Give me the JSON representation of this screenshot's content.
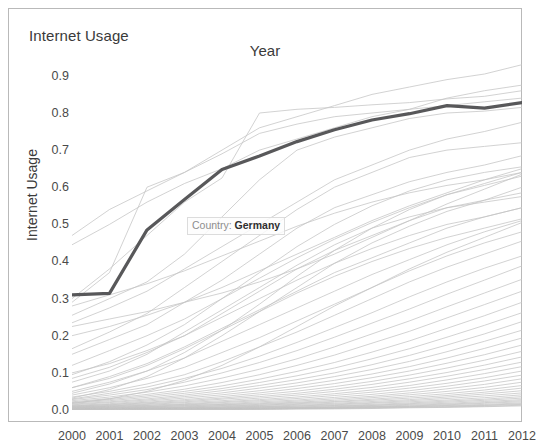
{
  "frame": {
    "corner_label": "Internet Usage",
    "title": "Year"
  },
  "tooltip": {
    "prefix": "Country:",
    "value": "Germany"
  },
  "chart_data": {
    "type": "line",
    "title": "Year",
    "corner_label": "Internet Usage",
    "xlabel": "Year",
    "ylabel": "Internet Usage",
    "xlim": [
      2000,
      2012
    ],
    "ylim": [
      0.0,
      0.94
    ],
    "grid": false,
    "legend": false,
    "x": [
      2000,
      2001,
      2002,
      2003,
      2004,
      2005,
      2006,
      2007,
      2008,
      2009,
      2010,
      2011,
      2012
    ],
    "xticks": [
      "2000",
      "2001",
      "2002",
      "2003",
      "2004",
      "2005",
      "2006",
      "2007",
      "2008",
      "2009",
      "2010",
      "2011",
      "2012"
    ],
    "yticks": [
      "0.0",
      "0.1",
      "0.2",
      "0.3",
      "0.4",
      "0.5",
      "0.6",
      "0.7",
      "0.8",
      "0.9"
    ],
    "ytick_values": [
      0.0,
      0.1,
      0.2,
      0.3,
      0.4,
      0.5,
      0.6,
      0.7,
      0.8,
      0.9
    ],
    "highlight_color": "#58585a",
    "background_color": "#c4c4c4",
    "annotation": "Country: Germany",
    "highlight_series": {
      "name": "Germany",
      "values": [
        0.31,
        0.314,
        0.485,
        0.567,
        0.648,
        0.684,
        0.723,
        0.755,
        0.781,
        0.798,
        0.82,
        0.813,
        0.828
      ]
    },
    "series": [
      {
        "name": "Germany",
        "highlighted": true,
        "values": [
          0.31,
          0.314,
          0.485,
          0.567,
          0.648,
          0.684,
          0.723,
          0.755,
          0.781,
          0.798,
          0.82,
          0.813,
          0.828
        ]
      },
      {
        "name": "country-a",
        "values": [
          0.47,
          0.54,
          0.59,
          0.64,
          0.7,
          0.76,
          0.79,
          0.82,
          0.85,
          0.87,
          0.89,
          0.905,
          0.93
        ]
      },
      {
        "name": "country-b",
        "values": [
          0.445,
          0.5,
          0.56,
          0.61,
          0.65,
          0.7,
          0.73,
          0.76,
          0.79,
          0.81,
          0.84,
          0.86,
          0.875
        ]
      },
      {
        "name": "country-c",
        "values": [
          0.3,
          0.38,
          0.47,
          0.56,
          0.625,
          0.8,
          0.81,
          0.815,
          0.822,
          0.828,
          0.838,
          0.845,
          0.86
        ]
      },
      {
        "name": "country-d",
        "values": [
          0.29,
          0.37,
          0.6,
          0.64,
          0.69,
          0.745,
          0.77,
          0.79,
          0.8,
          0.81,
          0.82,
          0.83,
          0.84
        ]
      },
      {
        "name": "country-e",
        "values": [
          0.255,
          0.3,
          0.345,
          0.42,
          0.52,
          0.62,
          0.7,
          0.735,
          0.76,
          0.785,
          0.8,
          0.805,
          0.815
        ]
      },
      {
        "name": "country-f",
        "values": [
          0.235,
          0.275,
          0.32,
          0.38,
          0.44,
          0.5,
          0.56,
          0.62,
          0.66,
          0.7,
          0.73,
          0.75,
          0.775
        ]
      },
      {
        "name": "country-g",
        "values": [
          0.165,
          0.21,
          0.26,
          0.33,
          0.4,
          0.47,
          0.54,
          0.6,
          0.64,
          0.68,
          0.7,
          0.71,
          0.72
        ]
      },
      {
        "name": "country-h",
        "values": [
          0.15,
          0.19,
          0.23,
          0.29,
          0.35,
          0.42,
          0.49,
          0.545,
          0.58,
          0.615,
          0.64,
          0.66,
          0.685
        ]
      },
      {
        "name": "country-i",
        "values": [
          0.095,
          0.13,
          0.175,
          0.23,
          0.3,
          0.37,
          0.44,
          0.5,
          0.55,
          0.59,
          0.62,
          0.64,
          0.655
        ]
      },
      {
        "name": "country-j",
        "values": [
          0.085,
          0.115,
          0.155,
          0.2,
          0.26,
          0.32,
          0.38,
          0.43,
          0.47,
          0.51,
          0.545,
          0.565,
          0.585
        ]
      },
      {
        "name": "country-k",
        "values": [
          0.06,
          0.09,
          0.125,
          0.17,
          0.22,
          0.27,
          0.32,
          0.37,
          0.41,
          0.45,
          0.49,
          0.52,
          0.545
        ]
      },
      {
        "name": "country-l",
        "values": [
          0.05,
          0.075,
          0.105,
          0.14,
          0.185,
          0.23,
          0.275,
          0.32,
          0.365,
          0.405,
          0.445,
          0.48,
          0.51
        ]
      },
      {
        "name": "country-m",
        "values": [
          0.04,
          0.06,
          0.085,
          0.115,
          0.155,
          0.195,
          0.24,
          0.285,
          0.33,
          0.375,
          0.415,
          0.45,
          0.48
        ]
      },
      {
        "name": "country-n",
        "values": [
          0.035,
          0.05,
          0.07,
          0.095,
          0.13,
          0.17,
          0.21,
          0.255,
          0.3,
          0.345,
          0.385,
          0.42,
          0.455
        ]
      },
      {
        "name": "country-o",
        "values": [
          0.03,
          0.045,
          0.062,
          0.085,
          0.112,
          0.145,
          0.182,
          0.222,
          0.262,
          0.305,
          0.345,
          0.382,
          0.415
        ]
      },
      {
        "name": "country-p",
        "values": [
          0.028,
          0.04,
          0.055,
          0.075,
          0.1,
          0.128,
          0.16,
          0.196,
          0.234,
          0.272,
          0.312,
          0.35,
          0.388
        ]
      },
      {
        "name": "country-q",
        "values": [
          0.025,
          0.035,
          0.048,
          0.065,
          0.086,
          0.11,
          0.138,
          0.17,
          0.205,
          0.24,
          0.278,
          0.315,
          0.352
        ]
      },
      {
        "name": "country-r",
        "values": [
          0.022,
          0.031,
          0.042,
          0.056,
          0.074,
          0.095,
          0.12,
          0.148,
          0.18,
          0.212,
          0.248,
          0.284,
          0.32
        ]
      },
      {
        "name": "country-s",
        "values": [
          0.02,
          0.028,
          0.038,
          0.05,
          0.065,
          0.083,
          0.104,
          0.128,
          0.156,
          0.186,
          0.22,
          0.254,
          0.29
        ]
      },
      {
        "name": "country-t",
        "values": [
          0.018,
          0.025,
          0.034,
          0.045,
          0.058,
          0.074,
          0.092,
          0.113,
          0.138,
          0.165,
          0.196,
          0.228,
          0.262
        ]
      },
      {
        "name": "country-u",
        "values": [
          0.016,
          0.022,
          0.03,
          0.04,
          0.052,
          0.066,
          0.082,
          0.1,
          0.122,
          0.147,
          0.175,
          0.205,
          0.238
        ]
      },
      {
        "name": "country-v",
        "values": [
          0.014,
          0.02,
          0.027,
          0.036,
          0.046,
          0.059,
          0.073,
          0.09,
          0.109,
          0.131,
          0.157,
          0.185,
          0.215
        ]
      },
      {
        "name": "country-w",
        "values": [
          0.012,
          0.017,
          0.024,
          0.032,
          0.041,
          0.052,
          0.065,
          0.08,
          0.097,
          0.117,
          0.14,
          0.166,
          0.194
        ]
      },
      {
        "name": "country-x",
        "values": [
          0.011,
          0.015,
          0.021,
          0.028,
          0.036,
          0.046,
          0.058,
          0.071,
          0.087,
          0.105,
          0.126,
          0.149,
          0.175
        ]
      },
      {
        "name": "country-y",
        "values": [
          0.01,
          0.014,
          0.019,
          0.025,
          0.032,
          0.041,
          0.051,
          0.063,
          0.077,
          0.094,
          0.113,
          0.134,
          0.158
        ]
      },
      {
        "name": "country-z",
        "values": [
          0.009,
          0.012,
          0.017,
          0.022,
          0.029,
          0.036,
          0.045,
          0.056,
          0.069,
          0.084,
          0.101,
          0.121,
          0.143
        ]
      },
      {
        "name": "country-aa",
        "values": [
          0.008,
          0.011,
          0.015,
          0.02,
          0.025,
          0.032,
          0.04,
          0.05,
          0.061,
          0.075,
          0.091,
          0.109,
          0.129
        ]
      },
      {
        "name": "country-ab",
        "values": [
          0.007,
          0.01,
          0.013,
          0.017,
          0.022,
          0.028,
          0.035,
          0.044,
          0.054,
          0.066,
          0.081,
          0.098,
          0.117
        ]
      },
      {
        "name": "country-ac",
        "values": [
          0.006,
          0.009,
          0.012,
          0.015,
          0.02,
          0.025,
          0.031,
          0.039,
          0.048,
          0.059,
          0.072,
          0.087,
          0.105
        ]
      },
      {
        "name": "country-ad",
        "values": [
          0.006,
          0.008,
          0.01,
          0.014,
          0.017,
          0.022,
          0.027,
          0.034,
          0.042,
          0.052,
          0.064,
          0.078,
          0.094
        ]
      },
      {
        "name": "country-ae",
        "values": [
          0.005,
          0.007,
          0.009,
          0.012,
          0.015,
          0.019,
          0.024,
          0.03,
          0.037,
          0.046,
          0.057,
          0.069,
          0.084
        ]
      },
      {
        "name": "country-af",
        "values": [
          0.004,
          0.006,
          0.008,
          0.011,
          0.014,
          0.017,
          0.021,
          0.026,
          0.033,
          0.041,
          0.05,
          0.061,
          0.075
        ]
      },
      {
        "name": "country-ag",
        "values": [
          0.004,
          0.005,
          0.007,
          0.009,
          0.012,
          0.015,
          0.019,
          0.023,
          0.029,
          0.036,
          0.044,
          0.054,
          0.066
        ]
      },
      {
        "name": "country-ah",
        "values": [
          0.003,
          0.005,
          0.006,
          0.008,
          0.011,
          0.013,
          0.017,
          0.021,
          0.026,
          0.032,
          0.039,
          0.048,
          0.059
        ]
      },
      {
        "name": "country-ai",
        "values": [
          0.003,
          0.004,
          0.005,
          0.007,
          0.009,
          0.012,
          0.015,
          0.018,
          0.023,
          0.028,
          0.035,
          0.043,
          0.052
        ]
      },
      {
        "name": "country-aj",
        "values": [
          0.002,
          0.003,
          0.005,
          0.006,
          0.008,
          0.01,
          0.013,
          0.016,
          0.02,
          0.025,
          0.031,
          0.038,
          0.046
        ]
      },
      {
        "name": "country-ak",
        "values": [
          0.002,
          0.003,
          0.004,
          0.005,
          0.007,
          0.009,
          0.011,
          0.014,
          0.018,
          0.022,
          0.027,
          0.033,
          0.041
        ]
      },
      {
        "name": "country-al",
        "values": [
          0.002,
          0.002,
          0.003,
          0.005,
          0.006,
          0.008,
          0.01,
          0.012,
          0.015,
          0.019,
          0.024,
          0.029,
          0.036
        ]
      },
      {
        "name": "country-am",
        "values": [
          0.001,
          0.002,
          0.003,
          0.004,
          0.005,
          0.007,
          0.008,
          0.011,
          0.013,
          0.017,
          0.021,
          0.026,
          0.032
        ]
      },
      {
        "name": "country-an",
        "values": [
          0.001,
          0.002,
          0.002,
          0.003,
          0.004,
          0.006,
          0.007,
          0.009,
          0.012,
          0.015,
          0.018,
          0.023,
          0.028
        ]
      },
      {
        "name": "country-ao",
        "values": [
          0.001,
          0.001,
          0.002,
          0.003,
          0.004,
          0.005,
          0.006,
          0.008,
          0.01,
          0.013,
          0.016,
          0.02,
          0.025
        ]
      },
      {
        "name": "country-ap",
        "values": [
          0.001,
          0.001,
          0.002,
          0.002,
          0.003,
          0.004,
          0.006,
          0.007,
          0.009,
          0.011,
          0.014,
          0.018,
          0.022
        ]
      },
      {
        "name": "country-aq",
        "values": [
          0.001,
          0.001,
          0.001,
          0.002,
          0.003,
          0.004,
          0.005,
          0.006,
          0.008,
          0.01,
          0.012,
          0.015,
          0.019
        ]
      },
      {
        "name": "country-ar",
        "values": [
          0.0,
          0.001,
          0.001,
          0.002,
          0.002,
          0.003,
          0.004,
          0.005,
          0.007,
          0.009,
          0.011,
          0.013,
          0.017
        ]
      },
      {
        "name": "country-as",
        "values": [
          0.0,
          0.001,
          0.001,
          0.001,
          0.002,
          0.003,
          0.004,
          0.005,
          0.006,
          0.008,
          0.009,
          0.012,
          0.015
        ]
      },
      {
        "name": "country-at",
        "values": [
          0.0,
          0.0,
          0.001,
          0.001,
          0.002,
          0.002,
          0.003,
          0.004,
          0.005,
          0.007,
          0.008,
          0.01,
          0.013
        ]
      },
      {
        "name": "country-au",
        "values": [
          0.0,
          0.0,
          0.001,
          0.001,
          0.001,
          0.002,
          0.003,
          0.003,
          0.004,
          0.006,
          0.007,
          0.009,
          0.011
        ]
      },
      {
        "name": "country-av",
        "values": [
          0.12,
          0.16,
          0.2,
          0.245,
          0.3,
          0.355,
          0.41,
          0.46,
          0.505,
          0.545,
          0.58,
          0.605,
          0.63
        ]
      },
      {
        "name": "country-aw",
        "values": [
          0.075,
          0.105,
          0.15,
          0.21,
          0.27,
          0.33,
          0.39,
          0.445,
          0.49,
          0.52,
          0.545,
          0.56,
          0.575
        ]
      },
      {
        "name": "country-ax",
        "values": [
          0.2,
          0.225,
          0.255,
          0.29,
          0.33,
          0.375,
          0.42,
          0.465,
          0.51,
          0.55,
          0.585,
          0.62,
          0.65
        ]
      },
      {
        "name": "country-ay",
        "values": [
          0.28,
          0.31,
          0.34,
          0.375,
          0.415,
          0.455,
          0.495,
          0.53,
          0.56,
          0.585,
          0.605,
          0.62,
          0.64
        ]
      },
      {
        "name": "country-az",
        "values": [
          0.225,
          0.245,
          0.265,
          0.29,
          0.315,
          0.345,
          0.38,
          0.42,
          0.465,
          0.51,
          0.555,
          0.595,
          0.635
        ]
      },
      {
        "name": "country-ba",
        "values": [
          0.045,
          0.07,
          0.105,
          0.155,
          0.215,
          0.285,
          0.36,
          0.43,
          0.49,
          0.54,
          0.58,
          0.61,
          0.64
        ]
      },
      {
        "name": "country-bb",
        "values": [
          0.032,
          0.055,
          0.09,
          0.14,
          0.2,
          0.265,
          0.33,
          0.395,
          0.45,
          0.495,
          0.535,
          0.565,
          0.6
        ]
      },
      {
        "name": "country-bc",
        "values": [
          0.1,
          0.125,
          0.16,
          0.2,
          0.25,
          0.3,
          0.35,
          0.395,
          0.435,
          0.47,
          0.5,
          0.52,
          0.545
        ]
      },
      {
        "name": "country-bd",
        "values": [
          0.06,
          0.085,
          0.12,
          0.165,
          0.215,
          0.265,
          0.315,
          0.36,
          0.4,
          0.435,
          0.465,
          0.49,
          0.515
        ]
      },
      {
        "name": "country-be",
        "values": [
          0.018,
          0.03,
          0.05,
          0.08,
          0.12,
          0.17,
          0.225,
          0.28,
          0.33,
          0.38,
          0.425,
          0.465,
          0.505
        ]
      }
    ]
  }
}
